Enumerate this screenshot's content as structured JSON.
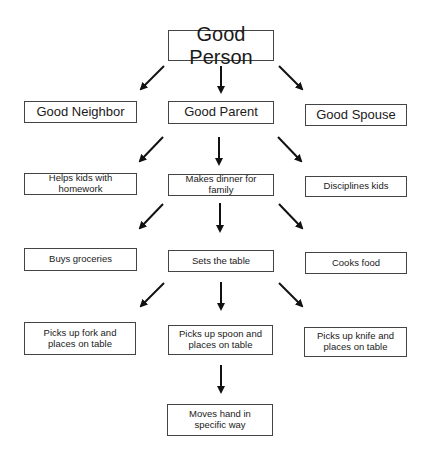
{
  "diagram": {
    "type": "hierarchy",
    "root": "Good Person",
    "nodes": {
      "good_person": "Good Person",
      "good_neighbor": "Good Neighbor",
      "good_parent": "Good Parent",
      "good_spouse": "Good Spouse",
      "helps_homework": "Helps kids with homework",
      "makes_dinner": "Makes dinner for family",
      "disciplines_kids": "Disciplines kids",
      "buys_groceries": "Buys groceries",
      "sets_table": "Sets the table",
      "cooks_food": "Cooks food",
      "fork": "Picks up fork and places on table",
      "spoon": "Picks up spoon and places on table",
      "knife": "Picks up knife and places on table",
      "moves_hand": "Moves hand in specific way"
    },
    "edges": [
      [
        "good_person",
        "good_neighbor"
      ],
      [
        "good_person",
        "good_parent"
      ],
      [
        "good_person",
        "good_spouse"
      ],
      [
        "good_parent",
        "helps_homework"
      ],
      [
        "good_parent",
        "makes_dinner"
      ],
      [
        "good_parent",
        "disciplines_kids"
      ],
      [
        "makes_dinner",
        "buys_groceries"
      ],
      [
        "makes_dinner",
        "sets_table"
      ],
      [
        "makes_dinner",
        "cooks_food"
      ],
      [
        "sets_table",
        "fork"
      ],
      [
        "sets_table",
        "spoon"
      ],
      [
        "sets_table",
        "knife"
      ],
      [
        "spoon",
        "moves_hand"
      ]
    ]
  }
}
